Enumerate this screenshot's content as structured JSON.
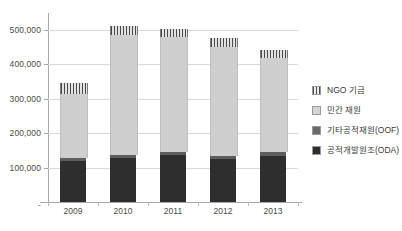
{
  "chart_data": {
    "type": "bar",
    "subtype": "stacked-bar",
    "title": "",
    "xlabel": "",
    "ylabel": "",
    "categories": [
      "2009",
      "2010",
      "2011",
      "2012",
      "2013"
    ],
    "ylim": [
      0,
      540000
    ],
    "yticks": [
      100000,
      200000,
      300000,
      400000,
      500000
    ],
    "ytick_labels": [
      "100,000",
      "200,000",
      "300,000",
      "400,000",
      "500,000"
    ],
    "zero_tick_label": "-",
    "grid": true,
    "legend_position": "right",
    "series": [
      {
        "name": "공적개발원조(ODA)",
        "color": "#2e2e2e",
        "pattern": "solid",
        "values": [
          119000,
          128000,
          136000,
          124000,
          134000
        ]
      },
      {
        "name": "기타공적재원(OOF)",
        "color": "#5e5e5e",
        "pattern": "solid",
        "values": [
          8000,
          9000,
          9000,
          9000,
          11000
        ]
      },
      {
        "name": "민간 재원",
        "color": "#cfcfcf",
        "pattern": "solid",
        "values": [
          188000,
          347000,
          334000,
          317000,
          272000
        ]
      },
      {
        "name": "NGO 기금",
        "color": "#4a4a4a",
        "pattern": "vertical-hatch",
        "values": [
          30000,
          26000,
          24000,
          27000,
          23000
        ]
      }
    ],
    "totals": [
      345000,
      510000,
      503000,
      477000,
      440000
    ]
  },
  "legend": {
    "items": [
      {
        "label": "NGO 기금",
        "swatch": "ngo-hatch-swatch"
      },
      {
        "label": "민간 재원",
        "swatch": "private-swatch"
      },
      {
        "label": "기타공적재원(OOF)",
        "swatch": "oof-swatch"
      },
      {
        "label": "공적개발원조(ODA)",
        "swatch": "oda-swatch"
      }
    ]
  }
}
